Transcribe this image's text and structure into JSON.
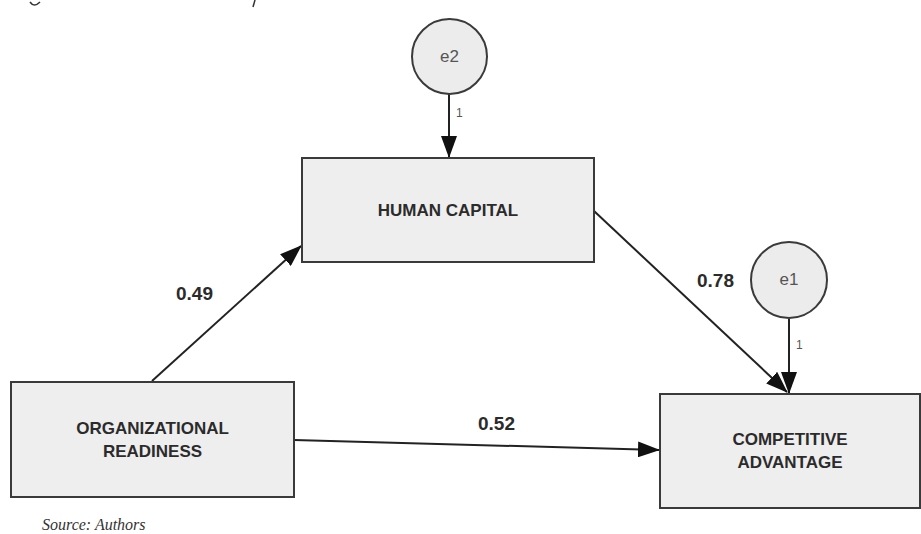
{
  "diagram": {
    "type": "structural-equation-path-model",
    "nodes": {
      "organizational_readiness": {
        "label_line1": "ORGANIZATIONAL",
        "label_line2": "READINESS"
      },
      "human_capital": {
        "label": "HUMAN CAPITAL"
      },
      "competitive_advantage": {
        "label_line1": "COMPETITIVE",
        "label_line2": "ADVANTAGE"
      }
    },
    "error_terms": {
      "e2": {
        "label": "e2",
        "fixed_loading": "1",
        "target": "HUMAN CAPITAL"
      },
      "e1": {
        "label": "e1",
        "fixed_loading": "1",
        "target": "COMPETITIVE ADVANTAGE"
      }
    },
    "paths": [
      {
        "from": "ORGANIZATIONAL READINESS",
        "to": "HUMAN CAPITAL",
        "coefficient": "0.49"
      },
      {
        "from": "HUMAN CAPITAL",
        "to": "COMPETITIVE ADVANTAGE",
        "coefficient": "0.78"
      },
      {
        "from": "ORGANIZATIONAL READINESS",
        "to": "COMPETITIVE ADVANTAGE",
        "coefficient": "0.52"
      }
    ],
    "source": "Source: Authors"
  }
}
